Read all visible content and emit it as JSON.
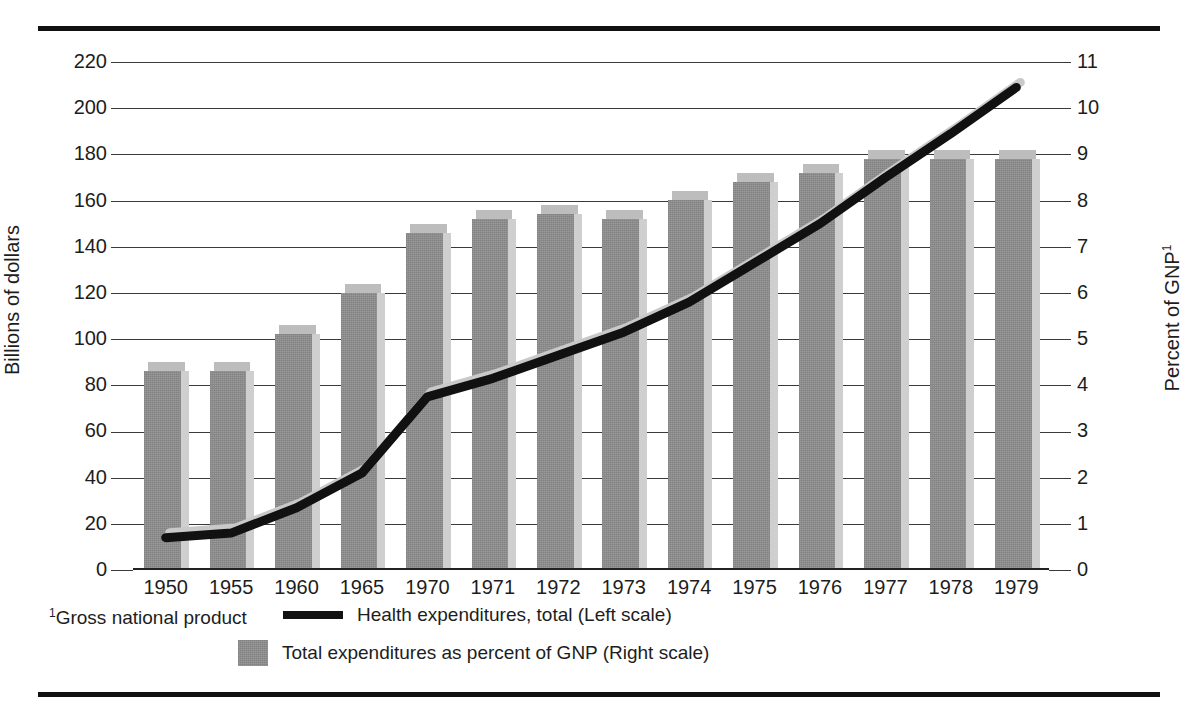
{
  "chart_data": {
    "type": "bar",
    "title": "",
    "subtitle": "",
    "categories": [
      "1950",
      "1955",
      "1960",
      "1965",
      "1970",
      "1971",
      "1972",
      "1973",
      "1974",
      "1975",
      "1976",
      "1977",
      "1978",
      "1979"
    ],
    "xlabel": "",
    "ylabel": "Billions of dollars",
    "ylabel_right": "Percent of GNP",
    "ylabel_right_footnote_marker": "1",
    "ylim": [
      0,
      220
    ],
    "ylim_right": [
      0,
      11
    ],
    "yticks": [
      "220",
      "200",
      "180",
      "160",
      "140",
      "120",
      "100",
      "80",
      "60",
      "40",
      "20",
      "0"
    ],
    "yticks_right": [
      "11",
      "10",
      "9",
      "8",
      "7",
      "6",
      "5",
      "4",
      "3",
      "2",
      "1",
      "0"
    ],
    "grid": true,
    "legend_position": "below",
    "series": [
      {
        "name": "Total expenditures as percent of GNP (Right scale)",
        "render": "bar",
        "axis": "right",
        "color": "#8c8c8c",
        "values": [
          4.5,
          4.5,
          5.3,
          6.2,
          7.5,
          7.8,
          7.9,
          7.8,
          8.2,
          8.6,
          8.8,
          9.1,
          9.1,
          9.1
        ]
      },
      {
        "name": "Health expenditures, total (Left scale)",
        "render": "line",
        "axis": "left",
        "color": "#111111",
        "values": [
          14,
          16,
          27,
          42,
          75,
          83,
          93,
          103,
          116,
          133,
          150,
          170,
          189,
          209
        ]
      }
    ],
    "annotations": [
      {
        "text": "Gross national product",
        "marker": "1",
        "position": "footnote-bottom-left"
      }
    ]
  },
  "axes": {
    "left": {
      "title": "Billions of dollars",
      "ticks": [
        "220",
        "200",
        "180",
        "160",
        "140",
        "120",
        "100",
        "80",
        "60",
        "40",
        "20",
        "0"
      ]
    },
    "right": {
      "title": "Percent of GNP",
      "title_sup": "1",
      "ticks": [
        "11",
        "10",
        "9",
        "8",
        "7",
        "6",
        "5",
        "4",
        "3",
        "2",
        "1",
        "0"
      ]
    },
    "bottom": {
      "ticks": [
        "1950",
        "1955",
        "1960",
        "1965",
        "1970",
        "1971",
        "1972",
        "1973",
        "1974",
        "1975",
        "1976",
        "1977",
        "1978",
        "1979"
      ]
    }
  },
  "legend": {
    "line_label": "Health expenditures, total (Left scale)",
    "bar_label": "Total expenditures as percent of GNP (Right scale)"
  },
  "footnote": {
    "marker": "1",
    "text": "Gross national product"
  },
  "colors": {
    "bar_face": "#8c8c8c",
    "bar_side": "#cfcfcf",
    "bar_top": "#bdbdbd",
    "line": "#111111",
    "grid": "#3a3a3a",
    "rule": "#111111",
    "background": "#ffffff"
  }
}
